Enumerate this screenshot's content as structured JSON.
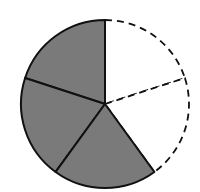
{
  "diagram": {
    "type": "fraction-pie",
    "total_parts": 5,
    "shaded_parts": 3,
    "center": [
      105,
      104
    ],
    "radius": 84,
    "start_angle_deg": 0,
    "shaded_fill": "#7a7a7a",
    "stroke": "#111111",
    "unshaded_fill": "#ffffff"
  }
}
